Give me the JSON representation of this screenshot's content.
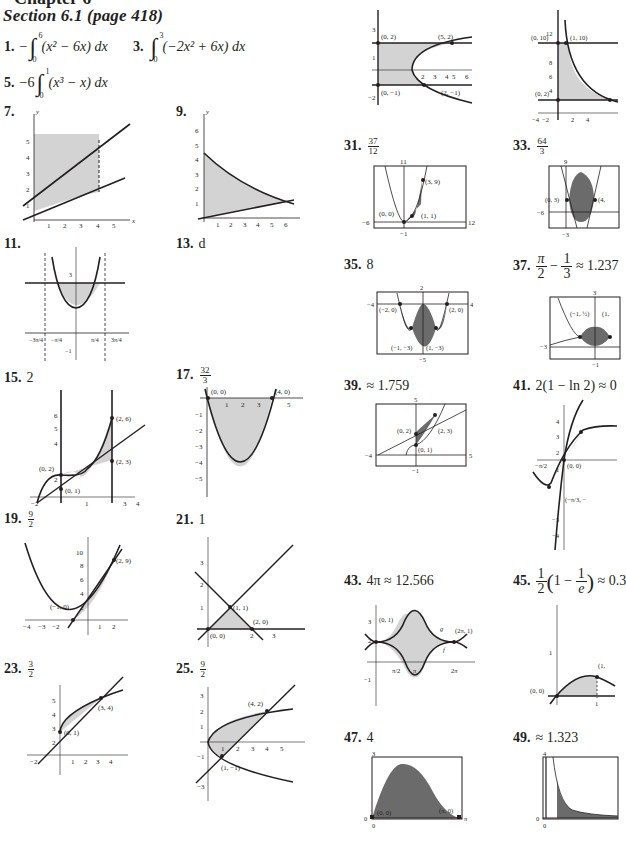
{
  "header": {
    "chapter": "Chapter 6",
    "section": "Section 6.1 (page 418)"
  },
  "answers": {
    "a1": {
      "num": "1.",
      "prefix": "−",
      "upper": "6",
      "lower": "0",
      "integrand": "(x² − 6x) dx"
    },
    "a3": {
      "num": "3.",
      "upper": "3",
      "lower": "0",
      "integrand": "(−2x² + 6x) dx"
    },
    "a5": {
      "num": "5.",
      "prefix": "−6",
      "upper": "1",
      "lower": "0",
      "integrand": "(x³ − x) dx"
    },
    "a7": {
      "num": "7."
    },
    "a9": {
      "num": "9."
    },
    "a11": {
      "num": "11."
    },
    "a13": {
      "num": "13.",
      "value": "d"
    },
    "a15": {
      "num": "15.",
      "value": "2"
    },
    "a17": {
      "num": "17.",
      "num_frac": "32",
      "den_frac": "3"
    },
    "a19": {
      "num": "19.",
      "num_frac": "9",
      "den_frac": "2"
    },
    "a21": {
      "num": "21.",
      "value": "1"
    },
    "a23": {
      "num": "23.",
      "num_frac": "3",
      "den_frac": "2"
    },
    "a25": {
      "num": "25.",
      "num_frac": "9",
      "den_frac": "2"
    },
    "a31": {
      "num": "31.",
      "num_frac": "37",
      "den_frac": "12"
    },
    "a33": {
      "num": "33.",
      "num_frac": "64",
      "den_frac": "3"
    },
    "a35": {
      "num": "35.",
      "value": "8"
    },
    "a37": {
      "num": "37.",
      "pi": "π",
      "two": "2",
      "one": "1",
      "three": "3",
      "minus": "−",
      "approx": "≈ 1.237"
    },
    "a39": {
      "num": "39.",
      "value": "≈ 1.759"
    },
    "a41": {
      "num": "41.",
      "value": "2(1 − ln 2) ≈ 0"
    },
    "a43": {
      "num": "43.",
      "value": "4π ≈ 12.566"
    },
    "a45": {
      "num": "45.",
      "one": "1",
      "two": "2",
      "inner": "1 −",
      "e": "e",
      "approx": "≈ 0.3"
    },
    "a47": {
      "num": "47.",
      "value": "4"
    },
    "a49": {
      "num": "49.",
      "value": "≈ 1.323"
    }
  },
  "graphs": {
    "g7": {
      "x_ticks": [
        "1",
        "2",
        "3",
        "4",
        "5"
      ],
      "y_ticks": [
        "1",
        "2",
        "3",
        "4",
        "5"
      ]
    },
    "g9": {
      "x_ticks": [
        "1",
        "2",
        "3",
        "4",
        "5",
        "6"
      ],
      "y_ticks": [
        "1",
        "2",
        "3",
        "4",
        "5",
        "6"
      ]
    },
    "g11": {
      "x_ticks": [
        "−3π/4",
        "−π/4",
        "π/4",
        "3π/4"
      ],
      "y_ticks": [
        "3",
        "−1"
      ]
    },
    "g15": {
      "points": [
        "(2, 6)",
        "(0, 2)",
        "(2, 3)",
        "(0, 1)"
      ],
      "x_ticks": [
        "−2",
        "1",
        "3",
        "4"
      ],
      "y_ticks": [
        "1",
        "2",
        "4",
        "5",
        "6"
      ]
    },
    "g17": {
      "points": [
        "(0, 0)",
        "(4, 0)"
      ],
      "x_ticks": [
        "1",
        "2",
        "3",
        "5"
      ],
      "y_ticks": [
        "−1",
        "−2",
        "−3",
        "−4",
        "−5"
      ]
    },
    "g19": {
      "points": [
        "(2, 9)",
        "(−1, 0)"
      ],
      "x_ticks": [
        "−4",
        "−3",
        "−2",
        "1",
        "2"
      ],
      "y_ticks": [
        "2",
        "4",
        "6",
        "8",
        "10"
      ]
    },
    "g21": {
      "points": [
        "(1, 1)",
        "(2, 0)",
        "(0, 0)"
      ],
      "x_ticks": [
        "2",
        "3"
      ],
      "y_ticks": [
        "1",
        "2",
        "3"
      ]
    },
    "g23": {
      "points": [
        "(3, 4)",
        "(0, 1)"
      ],
      "x_ticks": [
        "−2",
        "1",
        "2",
        "3",
        "4"
      ],
      "y_ticks": [
        "2",
        "3",
        "4",
        "5"
      ]
    },
    "g25": {
      "points": [
        "(4, 2)",
        "(1, −1)"
      ],
      "x_ticks": [
        "1",
        "2",
        "3",
        "4",
        "5"
      ],
      "y_ticks": [
        "3",
        "2",
        "1",
        "−1",
        "−3"
      ]
    },
    "g27": {
      "points": [
        "(0, 2)",
        "(5, 2)",
        "(0, −1)",
        "(2, −1)"
      ],
      "x_ticks": [
        "2",
        "3",
        "4",
        "5",
        "6"
      ],
      "y_ticks": [
        "3",
        "1",
        "−2"
      ]
    },
    "g29": {
      "points": [
        "(0, 10)",
        "(1, 10)",
        "(0, 2)"
      ],
      "x_ticks": [
        "−4",
        "−2",
        "2",
        "4"
      ],
      "y_ticks": [
        "12",
        "8",
        "6",
        "4"
      ]
    },
    "g31": {
      "points": [
        "(3, 9)",
        "(0, 0)",
        "(1, 1)"
      ],
      "window": {
        "xmin": "−6",
        "xmax": "12",
        "ymin": "−1",
        "ymax": "11"
      }
    },
    "g33": {
      "points": [
        "(0, 3)",
        "(4,"
      ],
      "window": {
        "xmin": "−6",
        "ymin": "−3",
        "ymax": "9"
      }
    },
    "g35": {
      "points": [
        "(−2, 0)",
        "(2, 0)",
        "(−1, −3)",
        "(1, −3)"
      ],
      "window": {
        "xmin": "−4",
        "xmax": "4",
        "ymin": "−5",
        "ymax": "2"
      }
    },
    "g37": {
      "points": [
        "(−1, ½)",
        "(1,"
      ],
      "window": {
        "xmin": "−3",
        "ymin": "−1",
        "ymax": "3"
      }
    },
    "g39": {
      "points": [
        "(0, 2)",
        "(2, 3)",
        "(0, 1)"
      ],
      "window": {
        "xmin": "−4",
        "xmax": "5",
        "ymin": "−1",
        "ymax": "5"
      }
    },
    "g41": {
      "points": [
        "(0, 0)",
        "(−π/3, −"
      ],
      "x_ticks": [
        "−π/2"
      ],
      "y_ticks": [
        "4",
        "3",
        "2",
        "1",
        "−3",
        "−4"
      ]
    },
    "g43": {
      "points": [
        "(0, 1)",
        "(2π, 1)"
      ],
      "labels": [
        "g",
        "f"
      ],
      "x_ticks": [
        "π/2",
        "π",
        "2π"
      ],
      "y_ticks": [
        "3",
        "2",
        "−1"
      ]
    },
    "g45": {
      "points": [
        "(0, 0)",
        "(1,"
      ],
      "x_ticks": [
        "1"
      ],
      "y_ticks": [
        "1"
      ]
    },
    "g47": {
      "points": [
        "(0, 0)",
        "(π, 0)"
      ],
      "window": {
        "xmin": "0",
        "xmax": "π",
        "ymin": "0",
        "ymax": "3"
      }
    },
    "g49": {
      "window": {
        "xmin": "0",
        "ymin": "0",
        "ymax": "4"
      }
    }
  },
  "axis": {
    "x": "x",
    "y": "y"
  },
  "colors": {
    "ink": "#231f20",
    "light_fill": "#d3d3d3",
    "dark_fill": "#6b6b6b",
    "page": "#ffffff"
  }
}
